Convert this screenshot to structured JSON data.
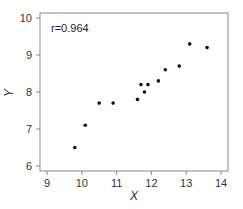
{
  "chart_data": {
    "type": "scatter",
    "title": "",
    "annotation": "r=0.964",
    "xlabel": "X",
    "ylabel": "Y",
    "xlim": [
      8.8,
      14.2
    ],
    "ylim": [
      5.85,
      10.15
    ],
    "xticks": [
      9,
      10,
      11,
      12,
      13,
      14
    ],
    "yticks": [
      6,
      7,
      8,
      9,
      10
    ],
    "grid": false,
    "legend": null,
    "points": [
      {
        "x": 9.8,
        "y": 6.5
      },
      {
        "x": 10.1,
        "y": 7.1
      },
      {
        "x": 10.5,
        "y": 7.7
      },
      {
        "x": 10.9,
        "y": 7.7
      },
      {
        "x": 11.6,
        "y": 7.8
      },
      {
        "x": 11.7,
        "y": 8.2
      },
      {
        "x": 11.8,
        "y": 8.0
      },
      {
        "x": 11.9,
        "y": 8.2
      },
      {
        "x": 12.2,
        "y": 8.3
      },
      {
        "x": 12.4,
        "y": 8.6
      },
      {
        "x": 12.8,
        "y": 8.7
      },
      {
        "x": 13.1,
        "y": 9.3
      },
      {
        "x": 13.6,
        "y": 9.2
      }
    ]
  }
}
